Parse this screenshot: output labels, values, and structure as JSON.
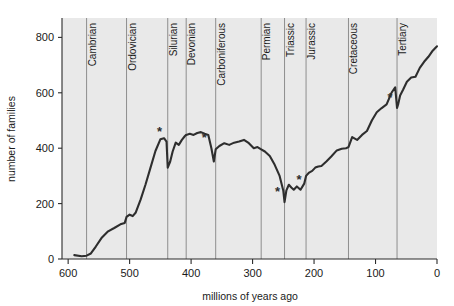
{
  "chart_data": {
    "type": "line",
    "title": "",
    "xlabel": "millions of years ago",
    "ylabel": "number of families",
    "xlim": [
      610,
      0
    ],
    "ylim": [
      0,
      870
    ],
    "x_reversed": true,
    "grid": false,
    "legend": "none",
    "xticks": [
      "600",
      "500",
      "400",
      "300",
      "200",
      "100",
      "0"
    ],
    "xtick_values": [
      600,
      500,
      400,
      300,
      200,
      100,
      0
    ],
    "yticks": [
      "0",
      "200",
      "400",
      "600",
      "800"
    ],
    "ytick_values": [
      0,
      200,
      400,
      600,
      800
    ],
    "series": [
      {
        "name": "marine family diversity",
        "x": [
          590,
          578,
          570,
          563,
          555,
          545,
          535,
          525,
          515,
          508,
          505,
          500,
          495,
          490,
          482,
          474,
          466,
          458,
          450,
          444,
          440,
          438,
          434,
          430,
          425,
          420,
          415,
          410,
          408,
          402,
          396,
          390,
          384,
          378,
          372,
          367,
          363,
          360,
          354,
          346,
          338,
          330,
          322,
          314,
          306,
          298,
          292,
          286,
          280,
          272,
          264,
          256,
          250,
          248,
          245,
          241,
          237,
          233,
          228,
          222,
          216,
          213,
          208,
          203,
          198,
          193,
          188,
          180,
          172,
          163,
          155,
          148,
          144,
          138,
          130,
          122,
          114,
          106,
          98,
          90,
          82,
          74,
          68,
          65,
          63,
          60,
          55,
          49,
          42,
          35,
          28,
          21,
          14,
          7,
          0
        ],
        "y": [
          14,
          10,
          12,
          20,
          45,
          78,
          100,
          112,
          125,
          130,
          152,
          160,
          155,
          168,
          215,
          270,
          330,
          390,
          432,
          436,
          424,
          330,
          352,
          388,
          420,
          412,
          430,
          444,
          448,
          452,
          448,
          455,
          458,
          452,
          448,
          400,
          352,
          396,
          408,
          418,
          412,
          420,
          424,
          430,
          418,
          400,
          404,
          396,
          388,
          372,
          340,
          300,
          246,
          205,
          248,
          268,
          258,
          250,
          262,
          250,
          272,
          300,
          312,
          318,
          330,
          334,
          336,
          352,
          370,
          392,
          398,
          400,
          404,
          440,
          430,
          448,
          462,
          500,
          530,
          545,
          558,
          600,
          620,
          545,
          560,
          590,
          612,
          640,
          655,
          658,
          690,
          712,
          730,
          752,
          768
        ],
        "note": "Sepkoski-style curve of marine animal family richness through Phanerozoic time"
      }
    ],
    "markers": [
      {
        "label": "*",
        "x": 440,
        "y": 424,
        "name": "end-ordovician-extinction"
      },
      {
        "label": "*",
        "x": 367,
        "y": 400,
        "name": "late-devonian-extinction"
      },
      {
        "label": "*",
        "x": 248,
        "y": 205,
        "name": "end-permian-extinction"
      },
      {
        "label": "*",
        "x": 213,
        "y": 250,
        "name": "end-triassic-extinction"
      },
      {
        "label": "*",
        "x": 65,
        "y": 545,
        "name": "end-cretaceous-extinction"
      }
    ],
    "periods": [
      {
        "name": "Cambrian",
        "start": 570,
        "end": 505
      },
      {
        "name": "Ordovician",
        "start": 505,
        "end": 438
      },
      {
        "name": "Silurian",
        "start": 438,
        "end": 408
      },
      {
        "name": "Devonian",
        "start": 408,
        "end": 360
      },
      {
        "name": "Carboniferous",
        "start": 360,
        "end": 286
      },
      {
        "name": "Permian",
        "start": 286,
        "end": 248
      },
      {
        "name": "Triassic",
        "start": 248,
        "end": 213
      },
      {
        "name": "Jurassic",
        "start": 213,
        "end": 144
      },
      {
        "name": "Cretaceous",
        "start": 144,
        "end": 65
      },
      {
        "name": "Tertiary",
        "start": 65,
        "end": 0
      }
    ],
    "colors": {
      "plot_background": "#e9e9e9",
      "page_background": "#ffffff",
      "line": "#2e2e2e",
      "divider": "#8e8e8e",
      "axis": "#2b2b2b",
      "text": "#1a1a1a"
    }
  }
}
